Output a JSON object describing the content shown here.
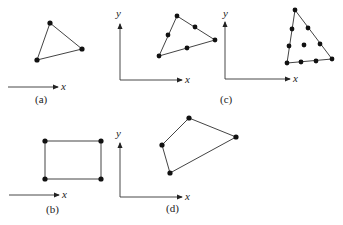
{
  "figure": {
    "panels": [
      {
        "id": "a",
        "caption": "(a)",
        "axes": "x-only",
        "axis_label_x": "x",
        "shape": "triangle",
        "vertices": [
          [
            50,
            23
          ],
          [
            82,
            49
          ],
          [
            37,
            60
          ]
        ],
        "nodes": [
          [
            50,
            23
          ],
          [
            82,
            49
          ],
          [
            37,
            60
          ]
        ]
      },
      {
        "id": "b",
        "caption": "(b)",
        "axes": "x-only",
        "axis_label_x": "x",
        "shape": "rectangle",
        "vertices": [
          [
            45,
            141
          ],
          [
            101,
            141
          ],
          [
            101,
            178
          ],
          [
            45,
            178
          ]
        ],
        "nodes": [
          [
            45,
            141
          ],
          [
            101,
            141
          ],
          [
            101,
            178
          ],
          [
            45,
            178
          ]
        ]
      },
      {
        "id": "c",
        "caption": "(c)",
        "axes": "xy",
        "axis_label_x": "x",
        "axis_label_y": "y",
        "shape": "triangles (quadratic and cubic)",
        "subfigures": [
          {
            "vertices": [
              [
                159,
                56
              ],
              [
                177,
                16
              ],
              [
                215,
                40
              ]
            ],
            "nodes": [
              [
                159,
                56
              ],
              [
                177,
                16
              ],
              [
                215,
                40
              ],
              [
                168,
                35
              ],
              [
                195,
                27
              ],
              [
                187,
                48
              ]
            ]
          },
          {
            "vertices": [
              [
                295,
                10
              ],
              [
                332,
                59
              ],
              [
                287,
                63
              ]
            ],
            "nodes": [
              [
                295,
                10
              ],
              [
                332,
                59
              ],
              [
                287,
                63
              ],
              [
                292,
                28
              ],
              [
                309,
                27
              ],
              [
                290,
                45
              ],
              [
                321,
                43
              ],
              [
                301,
                62
              ],
              [
                316,
                61
              ],
              [
                305,
                44
              ]
            ]
          }
        ]
      },
      {
        "id": "d",
        "caption": "(d)",
        "axes": "xy",
        "axis_label_x": "x",
        "axis_label_y": "y",
        "shape": "quadrilateral",
        "vertices": [
          [
            189,
            118
          ],
          [
            236,
            137
          ],
          [
            170,
            173
          ],
          [
            162,
            145
          ]
        ],
        "nodes": [
          [
            189,
            118
          ],
          [
            236,
            137
          ],
          [
            170,
            173
          ],
          [
            162,
            145
          ]
        ]
      }
    ]
  },
  "labels": {
    "x": "x",
    "y": "y",
    "a": "(a)",
    "b": "(b)",
    "c": "(c)",
    "d": "(d)"
  },
  "colors": {
    "line": "#444444",
    "node": "#111111"
  }
}
